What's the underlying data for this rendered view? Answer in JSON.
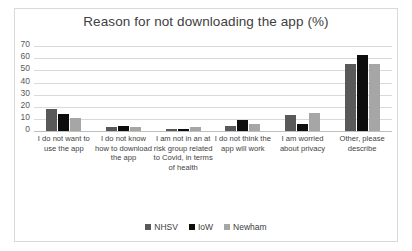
{
  "chart_data": {
    "type": "bar",
    "title": "Reason for not downloading the app (%)",
    "xlabel": "",
    "ylabel": "",
    "ylim": [
      0,
      70
    ],
    "yticks": [
      70,
      60,
      50,
      40,
      30,
      20,
      10,
      0
    ],
    "grid": true,
    "legend_position": "bottom",
    "categories": [
      "I do not want to use the app",
      "I do not know how to download the app",
      "I am not in an at risk group related to Covid, in terms of health",
      "I do not think the app will work",
      "I am worried about privacy",
      "Other, please describe"
    ],
    "series": [
      {
        "name": "NHSV",
        "color": "#595959",
        "values": [
          18,
          3,
          2,
          4,
          13,
          55
        ]
      },
      {
        "name": "IoW",
        "color": "#0d0d0d",
        "values": [
          14,
          4,
          2,
          9,
          6,
          63
        ]
      },
      {
        "name": "Newham",
        "color": "#a6a6a6",
        "values": [
          11,
          3,
          3,
          6,
          15,
          55
        ]
      }
    ]
  },
  "colors": {
    "gridline": "#d9d9d9",
    "border": "#d9d9d9",
    "title_text": "#404040",
    "axis_text": "#595959",
    "background": "#ffffff"
  }
}
